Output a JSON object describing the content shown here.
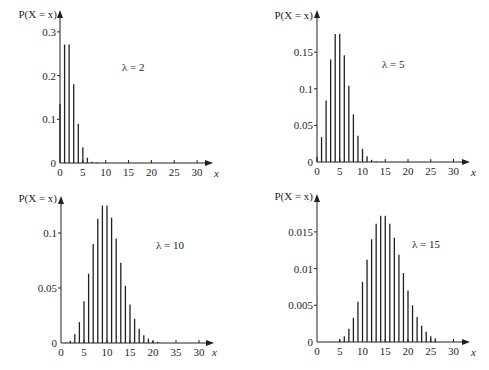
{
  "figure": {
    "background": "#ffffff",
    "ink_color": "#231f20"
  },
  "chart_data": [
    {
      "type": "bar",
      "title": "",
      "annotation": "λ = 2",
      "xlabel": "x",
      "ylabel": "P(X = x)",
      "x_ticks": [
        "0",
        "5",
        "10",
        "15",
        "20",
        "25",
        "30"
      ],
      "y_ticks": [
        "0",
        "0.1",
        "0.2",
        "0.3"
      ],
      "xlim": [
        0,
        33
      ],
      "ylim": [
        0,
        0.33
      ],
      "grid": false,
      "x": [
        0,
        1,
        2,
        3,
        4,
        5,
        6,
        7,
        8
      ],
      "values": [
        0.135,
        0.271,
        0.271,
        0.18,
        0.09,
        0.036,
        0.012,
        0.003,
        0.001
      ]
    },
    {
      "type": "bar",
      "title": "",
      "annotation": "λ = 5",
      "xlabel": "x",
      "ylabel": "P(X = x)",
      "x_ticks": [
        "0",
        "5",
        "10",
        "15",
        "20",
        "25",
        "30"
      ],
      "y_ticks": [
        "0",
        "0.05",
        "0.1",
        "0.15"
      ],
      "xlim": [
        0,
        33
      ],
      "ylim": [
        0,
        0.2
      ],
      "grid": false,
      "x": [
        0,
        1,
        2,
        3,
        4,
        5,
        6,
        7,
        8,
        9,
        10,
        11,
        12,
        13,
        14
      ],
      "values": [
        0.007,
        0.034,
        0.084,
        0.14,
        0.175,
        0.175,
        0.146,
        0.104,
        0.065,
        0.036,
        0.018,
        0.008,
        0.003,
        0.001,
        0.0005
      ]
    },
    {
      "type": "bar",
      "title": "",
      "annotation": "λ = 10",
      "xlabel": "x",
      "ylabel": "P(X = x)",
      "x_ticks": [
        "0",
        "5",
        "10",
        "15",
        "20",
        "35",
        "30"
      ],
      "y_ticks": [
        "0",
        "0.05",
        "0.1"
      ],
      "xlim": [
        0,
        33
      ],
      "ylim": [
        0,
        0.135
      ],
      "grid": false,
      "x": [
        0,
        1,
        2,
        3,
        4,
        5,
        6,
        7,
        8,
        9,
        10,
        11,
        12,
        13,
        14,
        15,
        16,
        17,
        18,
        19,
        20,
        21
      ],
      "values": [
        5e-05,
        0.0005,
        0.002,
        0.008,
        0.019,
        0.038,
        0.063,
        0.09,
        0.113,
        0.125,
        0.125,
        0.114,
        0.095,
        0.073,
        0.052,
        0.035,
        0.022,
        0.013,
        0.007,
        0.004,
        0.002,
        0.001
      ]
    },
    {
      "type": "bar",
      "title": "",
      "annotation": "λ = 15",
      "xlabel": "x",
      "ylabel": "P(X = x)",
      "x_ticks": [
        "0",
        "5",
        "10",
        "15",
        "20",
        "25",
        "30"
      ],
      "y_ticks": [
        "0",
        "0.005",
        "0.01",
        "0.015"
      ],
      "xlim": [
        0,
        33
      ],
      "ylim": [
        0,
        0.02
      ],
      "grid": false,
      "x": [
        5,
        6,
        7,
        8,
        9,
        10,
        11,
        12,
        13,
        14,
        15,
        16,
        17,
        18,
        19,
        20,
        21,
        22,
        23,
        24,
        25,
        26
      ],
      "values": [
        0.0003,
        0.0008,
        0.0018,
        0.0033,
        0.0055,
        0.0082,
        0.0112,
        0.014,
        0.0161,
        0.0172,
        0.0172,
        0.0161,
        0.0142,
        0.0119,
        0.0094,
        0.007,
        0.005,
        0.0034,
        0.0022,
        0.0014,
        0.0008,
        0.0005
      ]
    }
  ]
}
